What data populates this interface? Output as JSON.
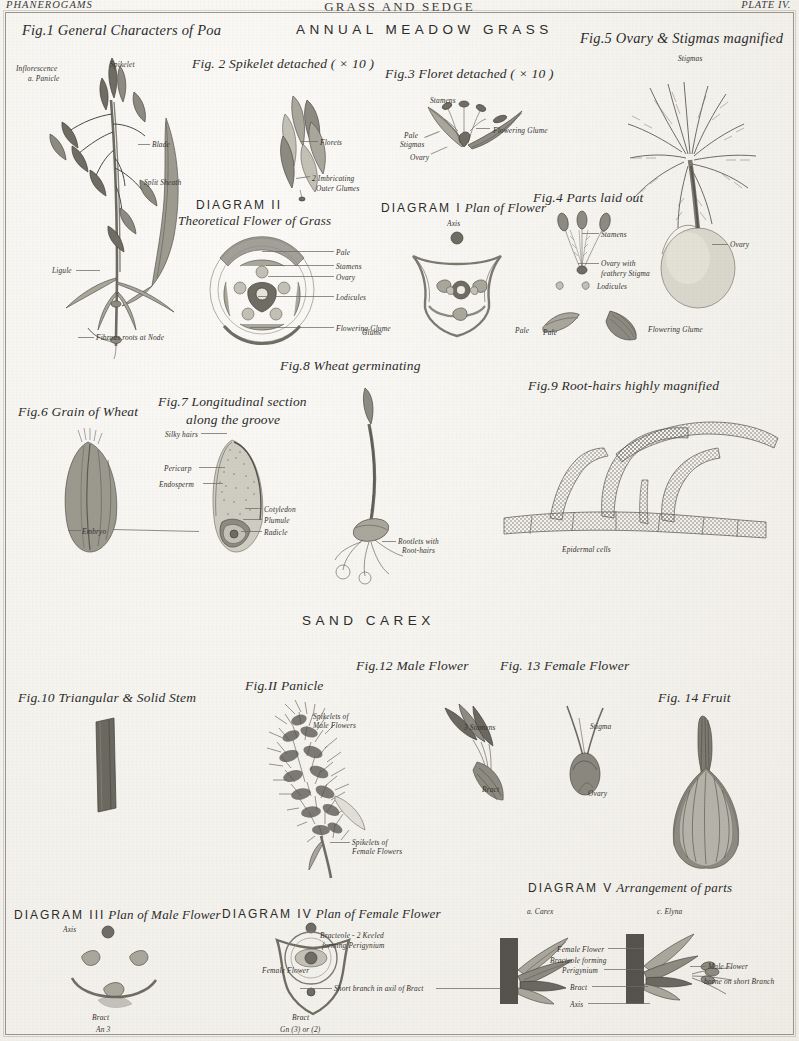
{
  "running_head": {
    "left": "PHANEROGAMS",
    "center": "GRASS AND SEDGE",
    "right": "PLATE IV."
  },
  "sections": [
    {
      "id": "grass",
      "title": "ANNUAL MEADOW GRASS"
    },
    {
      "id": "carex",
      "title": "SAND CAREX"
    }
  ],
  "figures": {
    "fig1": {
      "title": "Fig.1 General Characters of Poa",
      "labels": {
        "inflorescence": "Inflorescence",
        "panicle": "a. Panicle",
        "spikelet": "Spikelet",
        "blade": "Blade",
        "split_sheath": "Split Sheath",
        "ligule": "Ligule",
        "fibrous_roots": "Fibrous roots at Node"
      }
    },
    "fig2": {
      "title": "Fig. 2 Spikelet detached ( × 10 )",
      "labels": {
        "florets": "Florets",
        "glumes_line1": "2 Imbricating",
        "glumes_line2": "Outer Glumes"
      }
    },
    "fig3": {
      "title": "Fig.3 Floret detached ( × 10 )",
      "labels": {
        "stamens": "Stamens",
        "pale": "Pale",
        "stigmas": "Stigmas",
        "ovary": "Ovary",
        "flowering_glume": "Flowering Glume"
      }
    },
    "fig4": {
      "title": "Fig.4 Parts laid out",
      "labels": {
        "stamens": "Stamens",
        "ovary_line1": "Ovary with",
        "ovary_line2": "feathery Stigma",
        "lodicules": "Lodicules",
        "pale": "Pale",
        "flowering_glume": "Flowering Glume"
      }
    },
    "fig5": {
      "title": "Fig.5 Ovary & Stigmas magnified",
      "labels": {
        "stigmas": "Stigmas",
        "ovary": "Ovary"
      }
    },
    "fig6": {
      "title": "Fig.6 Grain of Wheat",
      "labels": {
        "embryo": "Embryo"
      }
    },
    "fig7": {
      "title_line1": "Fig.7 Longitudinal section",
      "title_line2": "along the groove",
      "labels": {
        "silky_hairs": "Silky hairs",
        "pericarp": "Pericarp",
        "endosperm": "Endosperm",
        "cotyledon": "Cotyledon",
        "plumule": "Plumule",
        "radicle": "Radicle"
      }
    },
    "fig8": {
      "title": "Fig.8 Wheat germinating",
      "labels": {
        "rootlets_line1": "Rootlets with",
        "rootlets_line2": "Root-hairs"
      }
    },
    "fig9": {
      "title": "Fig.9 Root-hairs highly magnified",
      "labels": {
        "epidermal_cells": "Epidermal cells"
      }
    },
    "fig10": {
      "title": "Fig.10 Triangular & Solid Stem"
    },
    "fig11": {
      "title": "Fig.II Panicle",
      "labels": {
        "male_line1": "Spikelets of",
        "male_line2": "Male Flowers",
        "female_line1": "Spikelets of",
        "female_line2": "Female Flowers"
      }
    },
    "fig12": {
      "title": "Fig.12 Male Flower",
      "labels": {
        "stamens": "3 Stamens",
        "bract": "Bract"
      }
    },
    "fig13": {
      "title": "Fig. 13 Female Flower",
      "labels": {
        "stigma": "Stigma",
        "ovary": "Ovary"
      }
    },
    "fig14": {
      "title": "Fig. 14 Fruit"
    }
  },
  "diagrams": {
    "d1": {
      "number": "DIAGRAM I",
      "name": "Plan of Flower",
      "labels": {
        "axis": "Axis",
        "glume": "Glume",
        "pale": "Pale"
      }
    },
    "d2": {
      "number": "DIAGRAM II",
      "name": "Theoretical Flower of Grass",
      "labels": {
        "pale": "Pale",
        "stamens": "Stamens",
        "ovary": "Ovary",
        "lodicules": "Lodicules",
        "flowering_glume": "Flowering Glume"
      }
    },
    "d3": {
      "number": "DIAGRAM III",
      "name": "Plan of Male Flower",
      "labels": {
        "axis": "Axis",
        "bract": "Bract",
        "an3": "An 3"
      }
    },
    "d4": {
      "number": "DIAGRAM IV",
      "name": "Plan of Female Flower",
      "labels": {
        "bracteole_line1": "Bracteole - 2 Keeled",
        "bracteole_line2": "forming Perigynium",
        "female_flower": "Female Flower",
        "short_branch": "Short branch in axil of Bract",
        "bract": "Bract",
        "gn": "Gn (3) or (2)"
      }
    },
    "d5": {
      "number": "DIAGRAM V",
      "name": "Arrangement of parts",
      "labels": {
        "a_carex": "a. Carex",
        "c_elyna": "c. Elyna",
        "female_flower": "Female Flower",
        "bracteole_line1": "Bracteole forming",
        "bracteole_line2": "Perigynium",
        "bract": "Bract",
        "axis": "Axis",
        "male_line1": "Male Flower",
        "male_line2": "borne on short Branch"
      }
    }
  },
  "colors": {
    "paper": "#f4f2ed",
    "ink": "#4a4742",
    "ink_light": "#8d8a81",
    "frame": "#9a958c"
  }
}
